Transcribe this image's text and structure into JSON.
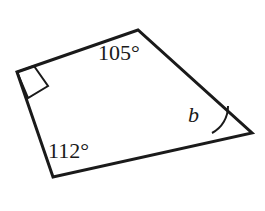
{
  "figure": {
    "type": "geometry-diagram",
    "shape": "quadrilateral",
    "background_color": "#ffffff",
    "stroke_color": "#1a1a1a",
    "stroke_width": 3,
    "vertices": [
      {
        "name": "top-left",
        "x": 17,
        "y": 72
      },
      {
        "name": "apex",
        "x": 138,
        "y": 30
      },
      {
        "name": "right",
        "x": 252,
        "y": 133
      },
      {
        "name": "bottom",
        "x": 53,
        "y": 177
      }
    ],
    "polygon_points": "17,72 138,30 252,133 53,177",
    "right_angle_marker": {
      "name": "right-angle-square",
      "points": "34,66 48,86 28,98 17,72",
      "vertex": "top-left"
    },
    "angle_arc": {
      "name": "angle-arc-b",
      "path": "M 212 133 A 30 30 0 0 0 228 106",
      "vertex": "right"
    },
    "labels": {
      "angle_top": "105°",
      "angle_bottom_left": "112°",
      "angle_right": "b"
    }
  }
}
